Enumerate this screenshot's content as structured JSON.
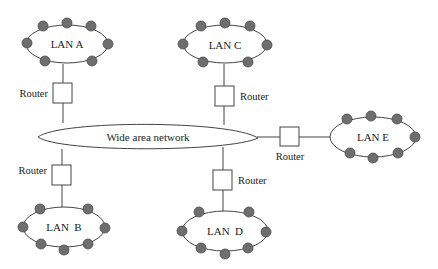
{
  "diagram": {
    "colors": {
      "line": "#444444",
      "node_fill": "#6e6e6e",
      "background": "#ffffff"
    },
    "wan": {
      "label": "Wide area network"
    },
    "lans": [
      {
        "id": "A",
        "label": "LAN A"
      },
      {
        "id": "B",
        "label": "LAN  B"
      },
      {
        "id": "C",
        "label": "LAN C"
      },
      {
        "id": "D",
        "label": "LAN  D"
      },
      {
        "id": "E",
        "label": "LAN E"
      }
    ],
    "routers": [
      {
        "id": "A",
        "label": "Router"
      },
      {
        "id": "B",
        "label": "Router"
      },
      {
        "id": "C",
        "label": "Router"
      },
      {
        "id": "D",
        "label": "Router"
      },
      {
        "id": "E",
        "label": "Router"
      }
    ]
  }
}
